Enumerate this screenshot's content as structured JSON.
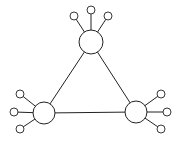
{
  "diagram": {
    "type": "network",
    "hubs": [
      {
        "id": "top",
        "cx": 91,
        "cy": 42,
        "r": 12,
        "leaves": [
          {
            "cx": 74,
            "cy": 16,
            "r": 4
          },
          {
            "cx": 91,
            "cy": 10,
            "r": 4
          },
          {
            "cx": 108,
            "cy": 16,
            "r": 4
          }
        ]
      },
      {
        "id": "left",
        "cx": 44,
        "cy": 113,
        "r": 11,
        "leaves": [
          {
            "cx": 20,
            "cy": 94,
            "r": 4
          },
          {
            "cx": 14,
            "cy": 112,
            "r": 4
          },
          {
            "cx": 20,
            "cy": 129,
            "r": 4
          }
        ]
      },
      {
        "id": "right",
        "cx": 136,
        "cy": 112,
        "r": 11,
        "leaves": [
          {
            "cx": 161,
            "cy": 94,
            "r": 4
          },
          {
            "cx": 167,
            "cy": 112,
            "r": 4
          },
          {
            "cx": 161,
            "cy": 129,
            "r": 4
          }
        ]
      }
    ],
    "edges": [
      [
        "top",
        "left"
      ],
      [
        "left",
        "right"
      ],
      [
        "right",
        "top"
      ]
    ],
    "colors": {
      "stroke": "#222222",
      "fill": "#ffffff",
      "background": "#ffffff"
    }
  }
}
